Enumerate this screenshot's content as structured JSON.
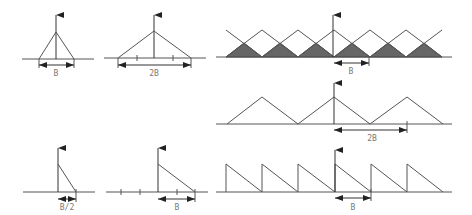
{
  "diagram": {
    "colors": {
      "line": "#555555",
      "shaded": "#666666",
      "background": "#ffffff",
      "label": "#777777"
    },
    "panels": [
      {
        "id": "triangle-narrow",
        "shape": "isosceles triangle",
        "label": "B"
      },
      {
        "id": "triangle-wide",
        "shape": "isosceles triangle",
        "label": "2B"
      },
      {
        "id": "overlapping-triangles",
        "shape": "periodic overlapping triangles, overlaps shaded",
        "label": "B"
      },
      {
        "id": "periodic-triangles",
        "shape": "periodic triangles",
        "label": "2B"
      },
      {
        "id": "half-triangle-narrow",
        "shape": "right triangle",
        "label": "B/2"
      },
      {
        "id": "half-triangle-wide",
        "shape": "right triangle",
        "label": "B"
      },
      {
        "id": "sawtooth",
        "shape": "periodic sawtooth",
        "label": "B"
      }
    ]
  }
}
